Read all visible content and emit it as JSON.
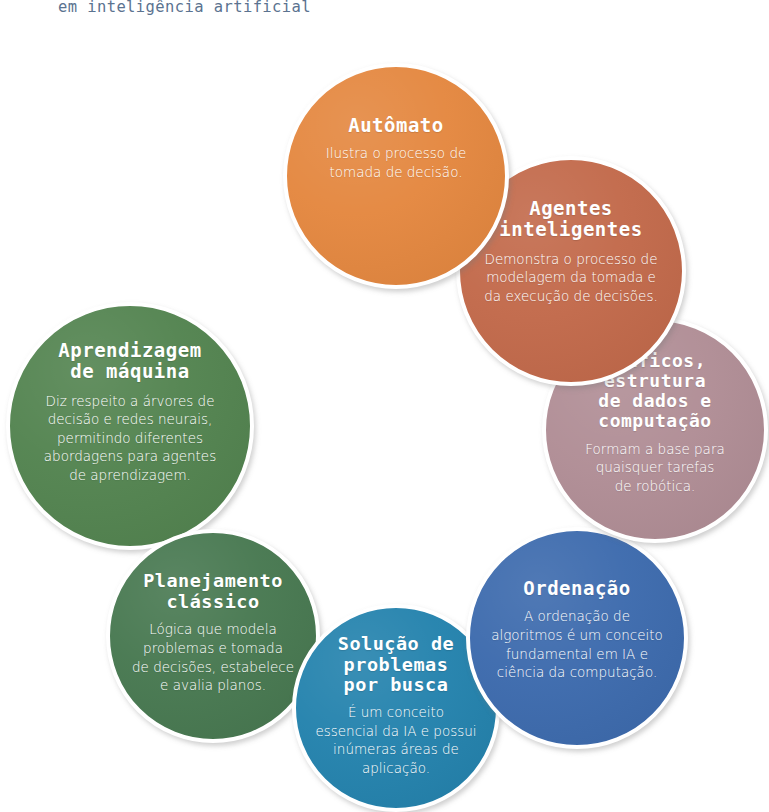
{
  "caption": "em inteligência artificial",
  "colors": {
    "caption_text": "#5b7390",
    "background": "#ffffff",
    "bubble_text": "#ffffff"
  },
  "bubbles": [
    {
      "id": "automato",
      "title": "Autômato",
      "body": "Ilustra o processo de\ntomada de decisão.",
      "color": "#e4873f"
    },
    {
      "id": "agentes",
      "title": "Agentes\ninteligentes",
      "body": "Demonstra o processo de\nmodelagem da tomada e\nda execução de decisões.",
      "color": "#c2694a"
    },
    {
      "id": "graficos",
      "title": "Gráficos,\nestrutura\nde dados e\ncomputação",
      "body": "Formam a base para\nquaisquer tarefas\nde robótica.",
      "color": "#b08d95"
    },
    {
      "id": "ordenacao",
      "title": "Ordenação",
      "body": "A ordenação de\nalgoritmos é um conceito\nfundamental em IA e\nciência da computação.",
      "color": "#3c6aad"
    },
    {
      "id": "solucao",
      "title": "Solução de\nproblemas\npor busca",
      "body": "É um conceito\nessencial da IA e possui\ninúmeras áreas de\naplicação.",
      "color": "#2382ad"
    },
    {
      "id": "planejamento",
      "title": "Planejamento\nclássico",
      "body": "Lógica que modela\nproblemas e tomada\nde decisões, estabelece\ne avalia planos.",
      "color": "#477850"
    },
    {
      "id": "aprendizagem",
      "title": "Aprendizagem\nde máquina",
      "body": "Diz respeito a árvores de\ndecisão e redes neurais,\npermitindo diferentes\nabordagens para agentes\nde aprendizagem.",
      "color": "#52834f"
    }
  ]
}
